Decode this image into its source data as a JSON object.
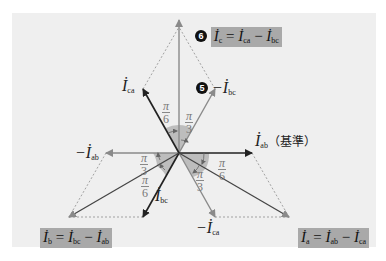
{
  "diagram": {
    "colors": {
      "background": "#ffffff",
      "panel": "#efefef",
      "highlight_box": "#a9a9a9",
      "solid_vector": "#222222",
      "gray_vector": "#8a8a8a",
      "angle_fill": "#b5b5b5",
      "marker": "#111111"
    },
    "vectors": [
      {
        "id": "I_ab",
        "label": "İ",
        "sub": "ab",
        "suffix": "（基準）",
        "angle_deg": 0,
        "style": "solid"
      },
      {
        "id": "-I_ab",
        "label": "−İ",
        "sub": "ab",
        "angle_deg": 180,
        "style": "gray"
      },
      {
        "id": "I_bc",
        "label": "İ",
        "sub": "bc",
        "angle_deg": 240,
        "style": "solid"
      },
      {
        "id": "-I_bc",
        "label": "−İ",
        "sub": "bc",
        "angle_deg": 60,
        "style": "gray",
        "marker": "5"
      },
      {
        "id": "I_ca",
        "label": "İ",
        "sub": "ca",
        "angle_deg": 120,
        "style": "solid"
      },
      {
        "id": "-I_ca",
        "label": "−İ",
        "sub": "ca",
        "angle_deg": 300,
        "style": "gray"
      },
      {
        "id": "I_a",
        "angle_deg": -30,
        "style": "solid"
      },
      {
        "id": "I_b",
        "angle_deg": 210,
        "style": "solid"
      },
      {
        "id": "I_c",
        "angle_deg": 90,
        "style": "gray"
      }
    ],
    "labels": {
      "i_ab": {
        "sym": "İ",
        "sub": "ab",
        "note": "（基準）"
      },
      "neg_i_ab": {
        "sym": "−İ",
        "sub": "ab"
      },
      "i_ca": {
        "sym": "İ",
        "sub": "ca"
      },
      "neg_i_bc": {
        "marker": "5",
        "sym": "−İ",
        "sub": "bc"
      },
      "i_bc": {
        "sym": "İ",
        "sub": "bc"
      },
      "neg_i_ca": {
        "sym": "−İ",
        "sub": "ca"
      }
    },
    "equations": {
      "i_c": {
        "marker": "6",
        "lhs": "İ",
        "lhs_sub": "c",
        "eq": " = ",
        "t1": "İ",
        "t1_sub": "ca",
        "op": " − ",
        "t2": "İ",
        "t2_sub": "bc"
      },
      "i_b": {
        "lhs": "İ",
        "lhs_sub": "b",
        "eq": " = ",
        "t1": "İ",
        "t1_sub": "bc",
        "op": " − ",
        "t2": "İ",
        "t2_sub": "ab"
      },
      "i_a": {
        "lhs": "İ",
        "lhs_sub": "a",
        "eq": " = ",
        "t1": "İ",
        "t1_sub": "ab",
        "op": " − ",
        "t2": "İ",
        "t2_sub": "ca"
      }
    },
    "angles": [
      {
        "num": "π",
        "den": "6",
        "position": "upper-left"
      },
      {
        "num": "π",
        "den": "3",
        "position": "upper-right"
      },
      {
        "num": "π",
        "den": "3",
        "position": "left"
      },
      {
        "num": "π",
        "den": "6",
        "position": "lower-left"
      },
      {
        "num": "π",
        "den": "3",
        "position": "lower-middle"
      },
      {
        "num": "π",
        "den": "6",
        "position": "right"
      }
    ]
  }
}
